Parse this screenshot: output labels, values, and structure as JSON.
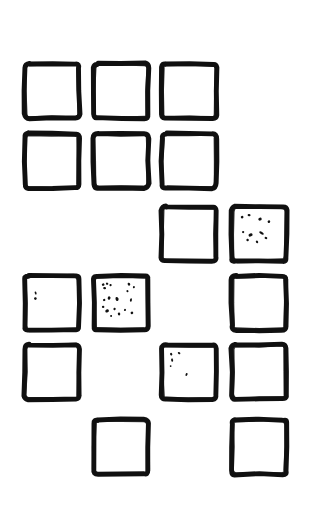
{
  "figure": {
    "canvas_width": 312,
    "canvas_height": 517,
    "background_color": "#ffffff",
    "stroke_color": "#111111",
    "fill_color": "#ffffff",
    "speck_color": "#111111"
  },
  "grid": {
    "columns": 4,
    "rows": 6,
    "cell_width": 62,
    "cell_height": 62,
    "column_x": [
      21,
      90,
      158,
      228
    ],
    "row_y": [
      60,
      130,
      203,
      272,
      341,
      416
    ],
    "stroke_width": 5
  },
  "cells": [
    {
      "id": "r1c1",
      "row": 1,
      "col": 1,
      "present": true,
      "speckle": "none",
      "label": "Square R1C1"
    },
    {
      "id": "r1c2",
      "row": 1,
      "col": 2,
      "present": true,
      "speckle": "none",
      "label": "Square R1C2"
    },
    {
      "id": "r1c3",
      "row": 1,
      "col": 3,
      "present": true,
      "speckle": "none",
      "label": "Square R1C3"
    },
    {
      "id": "r1c4",
      "row": 1,
      "col": 4,
      "present": false,
      "speckle": "none",
      "label": "Empty R1C4"
    },
    {
      "id": "r2c1",
      "row": 2,
      "col": 1,
      "present": true,
      "speckle": "none",
      "label": "Square R2C1"
    },
    {
      "id": "r2c2",
      "row": 2,
      "col": 2,
      "present": true,
      "speckle": "none",
      "label": "Square R2C2"
    },
    {
      "id": "r2c3",
      "row": 2,
      "col": 3,
      "present": true,
      "speckle": "none",
      "label": "Square R2C3"
    },
    {
      "id": "r2c4",
      "row": 2,
      "col": 4,
      "present": false,
      "speckle": "none",
      "label": "Empty R2C4"
    },
    {
      "id": "r3c1",
      "row": 3,
      "col": 1,
      "present": false,
      "speckle": "none",
      "label": "Empty R3C1"
    },
    {
      "id": "r3c2",
      "row": 3,
      "col": 2,
      "present": false,
      "speckle": "none",
      "label": "Empty R3C2"
    },
    {
      "id": "r3c3",
      "row": 3,
      "col": 3,
      "present": true,
      "speckle": "none",
      "label": "Square R3C3"
    },
    {
      "id": "r3c4",
      "row": 3,
      "col": 4,
      "present": true,
      "speckle": "heavy",
      "label": "Speckled square R3C4"
    },
    {
      "id": "r4c1",
      "row": 4,
      "col": 1,
      "present": true,
      "speckle": "light",
      "label": "Lightly speckled square R4C1"
    },
    {
      "id": "r4c2",
      "row": 4,
      "col": 2,
      "present": true,
      "speckle": "dense",
      "label": "Densely speckled square R4C2"
    },
    {
      "id": "r4c3",
      "row": 4,
      "col": 3,
      "present": false,
      "speckle": "none",
      "label": "Empty R4C3"
    },
    {
      "id": "r4c4",
      "row": 4,
      "col": 4,
      "present": true,
      "speckle": "none",
      "label": "Square R4C4"
    },
    {
      "id": "r5c1",
      "row": 5,
      "col": 1,
      "present": true,
      "speckle": "none",
      "label": "Square R5C1"
    },
    {
      "id": "r5c2",
      "row": 5,
      "col": 2,
      "present": false,
      "speckle": "none",
      "label": "Empty R5C2"
    },
    {
      "id": "r5c3",
      "row": 5,
      "col": 3,
      "present": true,
      "speckle": "light",
      "label": "Lightly speckled square R5C3"
    },
    {
      "id": "r5c4",
      "row": 5,
      "col": 4,
      "present": true,
      "speckle": "none",
      "label": "Square R5C4"
    },
    {
      "id": "r6c1",
      "row": 6,
      "col": 1,
      "present": false,
      "speckle": "none",
      "label": "Empty R6C1"
    },
    {
      "id": "r6c2",
      "row": 6,
      "col": 2,
      "present": true,
      "speckle": "none",
      "label": "Square R6C2"
    },
    {
      "id": "r6c3",
      "row": 6,
      "col": 3,
      "present": false,
      "speckle": "none",
      "label": "Empty R6C3"
    },
    {
      "id": "r6c4",
      "row": 6,
      "col": 4,
      "present": true,
      "speckle": "none",
      "label": "Square R6C4"
    }
  ],
  "speckle_patterns": {
    "none": [],
    "light": [
      {
        "x": 0.17,
        "y": 0.3,
        "w": 0.035,
        "h": 0.065,
        "r": -18
      },
      {
        "x": 0.165,
        "y": 0.41,
        "w": 0.055,
        "h": 0.055,
        "r": 12
      }
    ],
    "light_alt": [
      {
        "x": 0.14,
        "y": 0.14,
        "w": 0.045,
        "h": 0.055,
        "r": -25
      },
      {
        "x": 0.3,
        "y": 0.12,
        "w": 0.055,
        "h": 0.04,
        "r": 35
      },
      {
        "x": 0.16,
        "y": 0.26,
        "w": 0.04,
        "h": 0.07,
        "r": -10
      },
      {
        "x": 0.13,
        "y": 0.38,
        "w": 0.035,
        "h": 0.035,
        "r": 0
      },
      {
        "x": 0.45,
        "y": 0.55,
        "w": 0.04,
        "h": 0.06,
        "r": 20
      }
    ],
    "heavy": [
      {
        "x": 0.16,
        "y": 0.16,
        "w": 0.055,
        "h": 0.05,
        "r": -30
      },
      {
        "x": 0.3,
        "y": 0.12,
        "w": 0.06,
        "h": 0.045,
        "r": 15
      },
      {
        "x": 0.52,
        "y": 0.2,
        "w": 0.07,
        "h": 0.06,
        "r": -12
      },
      {
        "x": 0.7,
        "y": 0.25,
        "w": 0.05,
        "h": 0.055,
        "r": 40
      },
      {
        "x": 0.18,
        "y": 0.46,
        "w": 0.045,
        "h": 0.045,
        "r": 0
      },
      {
        "x": 0.33,
        "y": 0.52,
        "w": 0.085,
        "h": 0.06,
        "r": -22
      },
      {
        "x": 0.55,
        "y": 0.48,
        "w": 0.1,
        "h": 0.05,
        "r": 28
      },
      {
        "x": 0.27,
        "y": 0.62,
        "w": 0.05,
        "h": 0.05,
        "r": 10
      },
      {
        "x": 0.46,
        "y": 0.66,
        "w": 0.045,
        "h": 0.055,
        "r": -35
      },
      {
        "x": 0.64,
        "y": 0.58,
        "w": 0.055,
        "h": 0.045,
        "r": 18
      }
    ],
    "dense": [
      {
        "x": 0.14,
        "y": 0.13,
        "w": 0.055,
        "h": 0.05,
        "r": -20
      },
      {
        "x": 0.22,
        "y": 0.11,
        "w": 0.05,
        "h": 0.045,
        "r": 25
      },
      {
        "x": 0.29,
        "y": 0.14,
        "w": 0.045,
        "h": 0.045,
        "r": -5
      },
      {
        "x": 0.17,
        "y": 0.2,
        "w": 0.06,
        "h": 0.045,
        "r": 15
      },
      {
        "x": 0.66,
        "y": 0.12,
        "w": 0.05,
        "h": 0.06,
        "r": -28
      },
      {
        "x": 0.76,
        "y": 0.18,
        "w": 0.04,
        "h": 0.05,
        "r": 10
      },
      {
        "x": 0.63,
        "y": 0.26,
        "w": 0.045,
        "h": 0.04,
        "r": 32
      },
      {
        "x": 0.16,
        "y": 0.44,
        "w": 0.05,
        "h": 0.045,
        "r": -15
      },
      {
        "x": 0.26,
        "y": 0.4,
        "w": 0.055,
        "h": 0.07,
        "r": 20
      },
      {
        "x": 0.42,
        "y": 0.42,
        "w": 0.06,
        "h": 0.085,
        "r": -18
      },
      {
        "x": 0.7,
        "y": 0.44,
        "w": 0.04,
        "h": 0.07,
        "r": 12
      },
      {
        "x": 0.14,
        "y": 0.58,
        "w": 0.05,
        "h": 0.045,
        "r": 0
      },
      {
        "x": 0.22,
        "y": 0.66,
        "w": 0.075,
        "h": 0.06,
        "r": -24
      },
      {
        "x": 0.37,
        "y": 0.62,
        "w": 0.045,
        "h": 0.05,
        "r": 18
      },
      {
        "x": 0.46,
        "y": 0.72,
        "w": 0.05,
        "h": 0.06,
        "r": -8
      },
      {
        "x": 0.58,
        "y": 0.64,
        "w": 0.04,
        "h": 0.045,
        "r": 30
      },
      {
        "x": 0.72,
        "y": 0.7,
        "w": 0.055,
        "h": 0.05,
        "r": -30
      },
      {
        "x": 0.3,
        "y": 0.76,
        "w": 0.04,
        "h": 0.04,
        "r": 8
      }
    ]
  }
}
